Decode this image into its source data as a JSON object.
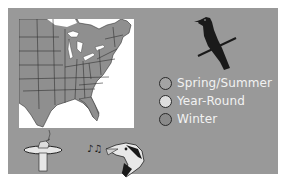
{
  "range_map": {
    "region": "Eastern United States",
    "colors": {
      "panel_background": "#999999",
      "map_background": "#ffffff",
      "state_fill": "#8f8f8f",
      "state_border": "#333333"
    }
  },
  "legend": {
    "items": [
      {
        "label": "Spring/Summer",
        "color": "#a3a3a3"
      },
      {
        "label": "Year-Round",
        "color": "#dedede"
      },
      {
        "label": "Winter",
        "color": "#8a8a8a"
      }
    ]
  },
  "icons": {
    "bird_silhouette": "perched-bird-icon",
    "birdbath": "birdbath-icon",
    "music_notes": "♪♫",
    "singing_bird_head": "woodpecker-head-icon"
  }
}
